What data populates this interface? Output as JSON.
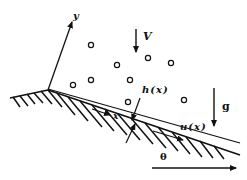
{
  "diagram": {
    "labels": {
      "y_axis": "y",
      "x_axis": "x",
      "velocity": "V",
      "gravity": "g",
      "film_thickness": "h(x)",
      "film_velocity": "u(x)",
      "angle": "θ"
    },
    "colors": {
      "ink": "#111111",
      "background": "#ffffff"
    },
    "particles": [
      {
        "cx": 91,
        "cy": 45
      },
      {
        "cx": 117,
        "cy": 65
      },
      {
        "cx": 148,
        "cy": 58
      },
      {
        "cx": 171,
        "cy": 63
      },
      {
        "cx": 73,
        "cy": 85
      },
      {
        "cx": 91,
        "cy": 80
      },
      {
        "cx": 130,
        "cy": 80
      },
      {
        "cx": 184,
        "cy": 100
      },
      {
        "cx": 128,
        "cy": 102
      }
    ]
  }
}
